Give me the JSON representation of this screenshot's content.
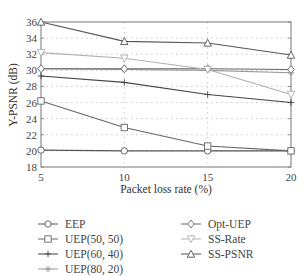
{
  "chart_data": {
    "type": "line",
    "title": "",
    "xlabel": "Packet loss rate (%)",
    "ylabel": "Y-PSNR (dB)",
    "x": [
      5,
      10,
      15,
      20
    ],
    "xlim": [
      5,
      20
    ],
    "ylim": [
      18,
      36
    ],
    "xticks": [
      "5",
      "10",
      "15",
      "20"
    ],
    "yticks": [
      "18",
      "20",
      "22",
      "24",
      "26",
      "28",
      "30",
      "32",
      "34",
      "36"
    ],
    "grid": true,
    "legend_position": "below",
    "series": [
      {
        "name": "EEP",
        "marker": "circle",
        "color": "#555555",
        "values": [
          20.1,
          20.0,
          20.0,
          20.0
        ]
      },
      {
        "name": "UEP(50, 50)",
        "marker": "square",
        "color": "#666666",
        "values": [
          26.2,
          22.9,
          20.6,
          20.0
        ]
      },
      {
        "name": "UEP(60, 40)",
        "marker": "plus",
        "color": "#444444",
        "values": [
          29.3,
          28.5,
          27.0,
          26.0
        ]
      },
      {
        "name": "UEP(80, 20)",
        "marker": "star",
        "color": "#999999",
        "values": [
          30.2,
          30.1,
          30.0,
          29.7
        ]
      },
      {
        "name": "Opt-UEP",
        "marker": "diamond",
        "color": "#666666",
        "values": [
          30.2,
          30.2,
          30.2,
          30.1
        ]
      },
      {
        "name": "SS-Rate",
        "marker": "triangle-down",
        "color": "#b0b0b0",
        "values": [
          32.2,
          31.5,
          30.1,
          27.0
        ]
      },
      {
        "name": "SS-PSNR",
        "marker": "triangle-up",
        "color": "#555555",
        "values": [
          36.0,
          33.6,
          33.4,
          31.9
        ]
      }
    ]
  },
  "legend": {
    "left": [
      "EEP",
      "UEP(50, 50)",
      "UEP(60, 40)",
      "UEP(80, 20)"
    ],
    "right": [
      "Opt-UEP",
      "SS-Rate",
      "SS-PSNR"
    ]
  }
}
